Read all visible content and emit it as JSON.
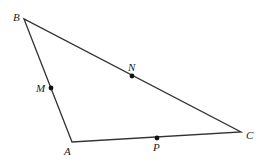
{
  "figure": {
    "type": "triangle",
    "stroke_color": "#333333",
    "points": {
      "A": {
        "label": "A",
        "x": 72,
        "y": 142
      },
      "B": {
        "label": "B",
        "x": 24,
        "y": 19
      },
      "C": {
        "label": "C",
        "x": 241,
        "y": 132
      }
    },
    "midpoints": {
      "M": {
        "label": "M",
        "x": 51,
        "y": 88,
        "on": "AB"
      },
      "N": {
        "label": "N",
        "x": 132,
        "y": 76,
        "on": "BC"
      },
      "P": {
        "label": "P",
        "x": 157,
        "y": 138,
        "on": "AC"
      }
    }
  }
}
